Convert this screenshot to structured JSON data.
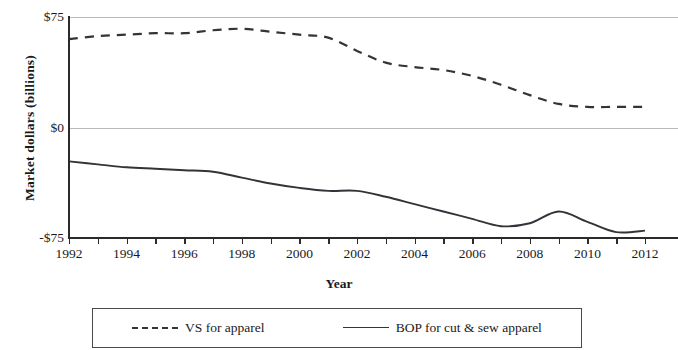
{
  "chart_data": {
    "type": "line",
    "title": "",
    "xlabel": "Year",
    "ylabel": "Market dollars (billions)",
    "xlim": [
      1992,
      2012
    ],
    "ylim": [
      -75,
      75
    ],
    "yticks": [
      75,
      0,
      -75
    ],
    "ytick_labels": [
      "$75",
      "$0",
      "-$75"
    ],
    "xticks": [
      1992,
      1993,
      1994,
      1995,
      1996,
      1997,
      1998,
      1999,
      2000,
      2001,
      2002,
      2003,
      2004,
      2005,
      2006,
      2007,
      2008,
      2009,
      2010,
      2011,
      2012
    ],
    "xtick_labels": [
      "1992",
      "1994",
      "1996",
      "1998",
      "2000",
      "2002",
      "2004",
      "2006",
      "2008",
      "2010",
      "2012"
    ],
    "xtick_labeled_values": [
      1992,
      1994,
      1996,
      1998,
      2000,
      2002,
      2004,
      2006,
      2008,
      2010,
      2012
    ],
    "grid": "horizontal",
    "legend_position": "below",
    "x": [
      1992,
      1993,
      1994,
      1995,
      1996,
      1997,
      1998,
      1999,
      2000,
      2001,
      2002,
      2003,
      2004,
      2005,
      2006,
      2007,
      2008,
      2009,
      2010,
      2011,
      2012
    ],
    "series": [
      {
        "name": "VS for apparel",
        "style": "dashed",
        "color": "#33333a",
        "values": [
          60,
          62,
          63,
          64,
          64,
          66,
          67,
          65,
          63,
          61,
          52,
          44,
          41,
          39,
          35,
          29,
          22,
          16,
          14,
          14,
          14
        ]
      },
      {
        "name": "BOP for cut & sew apparel",
        "style": "solid",
        "color": "#33333a",
        "values": [
          -23,
          -25,
          -27,
          -28,
          -29,
          -30,
          -34,
          -38,
          -41,
          -43,
          -43,
          -47,
          -52,
          -57,
          -62,
          -67,
          -65,
          -57,
          -64,
          -71,
          -70
        ]
      }
    ]
  },
  "axis": {
    "y_title": "Market dollars (billions)",
    "x_title": "Year"
  },
  "legend": {
    "items": [
      {
        "label": "VS for apparel",
        "style": "dashed"
      },
      {
        "label": "BOP for cut & sew apparel",
        "style": "solid"
      }
    ]
  },
  "colors": {
    "line": "#33333a",
    "axis": "#2b2b2b",
    "grid": "#b9b9b9",
    "background": "#ffffff"
  }
}
